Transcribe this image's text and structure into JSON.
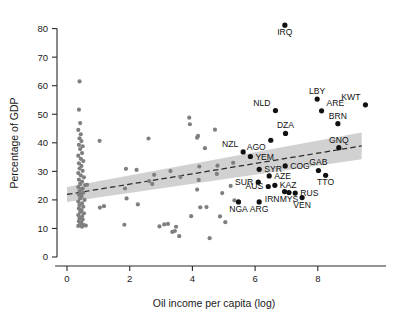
{
  "chart_data": {
    "type": "scatter",
    "title": "",
    "xlabel": "Oil income per capita (log)",
    "ylabel": "Percentage of GDP",
    "xlim": [
      -0.45,
      10.4
    ],
    "ylim": [
      -1.5,
      84
    ],
    "xticks": [
      0,
      2,
      4,
      6,
      8
    ],
    "yticks": [
      0,
      10,
      20,
      30,
      40,
      50,
      60,
      70,
      80
    ],
    "grid": false,
    "legend": null,
    "colors": {
      "background_points": "#7f7f7f",
      "labeled_points": "#111111",
      "confidence_band": "#bfbfbf",
      "fit_line": "#2b2b2b",
      "axis": "#2b2b2b"
    },
    "fit": {
      "type": "linear",
      "style": "dashed",
      "x_start": 0.0,
      "y_start": 21.9,
      "x_end": 9.4,
      "y_end": 38.9,
      "band_halfwidth_start": 2.6,
      "band_halfwidth_end": 4.7
    },
    "labeled_points": [
      {
        "label": "IRQ",
        "x": 6.95,
        "y": 81.2,
        "label_pos": "below"
      },
      {
        "label": "KWT",
        "x": 9.52,
        "y": 53.3,
        "label_pos": "above-left"
      },
      {
        "label": "LBY",
        "x": 7.98,
        "y": 55.3,
        "label_pos": "above"
      },
      {
        "label": "ARE",
        "x": 8.12,
        "y": 51.2,
        "label_pos": "above-right"
      },
      {
        "label": "BRN",
        "x": 8.64,
        "y": 46.7,
        "label_pos": "above"
      },
      {
        "label": "NLD",
        "x": 6.65,
        "y": 51.3,
        "label_pos": "above-left"
      },
      {
        "label": "DZA",
        "x": 6.97,
        "y": 43.3,
        "label_pos": "above"
      },
      {
        "label": "AGO",
        "x": 6.5,
        "y": 40.9,
        "label_pos": "below-left"
      },
      {
        "label": "GNQ",
        "x": 8.67,
        "y": 38.3,
        "label_pos": "above"
      },
      {
        "label": "NZL",
        "x": 5.62,
        "y": 36.8,
        "label_pos": "above-left"
      },
      {
        "label": "YEM",
        "x": 5.85,
        "y": 35.2,
        "label_pos": "right"
      },
      {
        "label": "SYR",
        "x": 6.13,
        "y": 30.7,
        "label_pos": "right"
      },
      {
        "label": "COG",
        "x": 6.96,
        "y": 31.9,
        "label_pos": "right"
      },
      {
        "label": "GAB",
        "x": 8.02,
        "y": 30.3,
        "label_pos": "above"
      },
      {
        "label": "TTO",
        "x": 8.25,
        "y": 28.6,
        "label_pos": "below"
      },
      {
        "label": "AZE",
        "x": 6.45,
        "y": 28.4,
        "label_pos": "right"
      },
      {
        "label": "SUR",
        "x": 6.1,
        "y": 26.2,
        "label_pos": "left"
      },
      {
        "label": "AUS",
        "x": 6.42,
        "y": 24.7,
        "label_pos": "left"
      },
      {
        "label": "KAZ",
        "x": 6.63,
        "y": 25.1,
        "label_pos": "right"
      },
      {
        "label": "IRN",
        "x": 6.94,
        "y": 22.9,
        "label_pos": "below-left"
      },
      {
        "label": "MYS",
        "x": 7.08,
        "y": 22.6,
        "label_pos": "below"
      },
      {
        "label": "RUS",
        "x": 7.28,
        "y": 22.4,
        "label_pos": "right"
      },
      {
        "label": "VEN",
        "x": 7.5,
        "y": 20.8,
        "label_pos": "below"
      },
      {
        "label": "NGA",
        "x": 5.47,
        "y": 19.3,
        "label_pos": "below"
      },
      {
        "label": "ARG",
        "x": 6.13,
        "y": 19.3,
        "label_pos": "below"
      }
    ],
    "background_points": [
      {
        "x": 0.4,
        "y": 61.5
      },
      {
        "x": 0.38,
        "y": 51.6
      },
      {
        "x": 0.42,
        "y": 46.9
      },
      {
        "x": 0.36,
        "y": 44.5
      },
      {
        "x": 0.44,
        "y": 43.0
      },
      {
        "x": 0.4,
        "y": 41.6
      },
      {
        "x": 0.46,
        "y": 40.6
      },
      {
        "x": 0.38,
        "y": 39.3
      },
      {
        "x": 0.5,
        "y": 38.8
      },
      {
        "x": 0.42,
        "y": 37.8
      },
      {
        "x": 0.48,
        "y": 36.4
      },
      {
        "x": 0.36,
        "y": 35.5
      },
      {
        "x": 0.44,
        "y": 34.4
      },
      {
        "x": 0.52,
        "y": 33.6
      },
      {
        "x": 0.38,
        "y": 32.8
      },
      {
        "x": 0.46,
        "y": 31.9
      },
      {
        "x": 0.4,
        "y": 31.0
      },
      {
        "x": 0.5,
        "y": 30.2
      },
      {
        "x": 0.36,
        "y": 29.4
      },
      {
        "x": 0.44,
        "y": 28.6
      },
      {
        "x": 0.54,
        "y": 27.9
      },
      {
        "x": 0.38,
        "y": 27.1
      },
      {
        "x": 0.48,
        "y": 26.4
      },
      {
        "x": 0.42,
        "y": 25.6
      },
      {
        "x": 0.58,
        "y": 25.2
      },
      {
        "x": 0.36,
        "y": 24.5
      },
      {
        "x": 0.46,
        "y": 23.8
      },
      {
        "x": 0.4,
        "y": 23.1
      },
      {
        "x": 0.52,
        "y": 22.5
      },
      {
        "x": 0.38,
        "y": 21.8
      },
      {
        "x": 0.46,
        "y": 21.2
      },
      {
        "x": 0.42,
        "y": 20.5
      },
      {
        "x": 0.56,
        "y": 20.0
      },
      {
        "x": 0.36,
        "y": 19.4
      },
      {
        "x": 0.48,
        "y": 18.8
      },
      {
        "x": 0.4,
        "y": 18.2
      },
      {
        "x": 0.52,
        "y": 17.6
      },
      {
        "x": 0.38,
        "y": 17.0
      },
      {
        "x": 0.46,
        "y": 16.4
      },
      {
        "x": 0.42,
        "y": 15.8
      },
      {
        "x": 0.54,
        "y": 15.3
      },
      {
        "x": 0.36,
        "y": 14.7
      },
      {
        "x": 0.48,
        "y": 14.2
      },
      {
        "x": 0.4,
        "y": 13.6
      },
      {
        "x": 0.5,
        "y": 13.1
      },
      {
        "x": 0.38,
        "y": 12.5
      },
      {
        "x": 0.46,
        "y": 12.0
      },
      {
        "x": 0.42,
        "y": 11.5
      },
      {
        "x": 0.54,
        "y": 11.2
      },
      {
        "x": 0.36,
        "y": 10.9
      },
      {
        "x": 0.48,
        "y": 10.6
      },
      {
        "x": 0.6,
        "y": 11.0
      },
      {
        "x": 0.44,
        "y": 22.0
      },
      {
        "x": 0.5,
        "y": 24.0
      },
      {
        "x": 0.64,
        "y": 25.3
      },
      {
        "x": 1.04,
        "y": 40.7
      },
      {
        "x": 1.05,
        "y": 17.3
      },
      {
        "x": 1.18,
        "y": 17.8
      },
      {
        "x": 1.88,
        "y": 30.9
      },
      {
        "x": 1.85,
        "y": 24.0
      },
      {
        "x": 1.9,
        "y": 20.5
      },
      {
        "x": 1.83,
        "y": 11.3
      },
      {
        "x": 2.22,
        "y": 30.5
      },
      {
        "x": 2.26,
        "y": 18.4
      },
      {
        "x": 2.6,
        "y": 41.5
      },
      {
        "x": 2.62,
        "y": 26.6
      },
      {
        "x": 2.78,
        "y": 28.8
      },
      {
        "x": 2.72,
        "y": 25.6
      },
      {
        "x": 2.95,
        "y": 10.7
      },
      {
        "x": 3.1,
        "y": 11.4
      },
      {
        "x": 3.22,
        "y": 11.6
      },
      {
        "x": 3.3,
        "y": 30.1
      },
      {
        "x": 3.36,
        "y": 8.8
      },
      {
        "x": 3.44,
        "y": 9.1
      },
      {
        "x": 3.48,
        "y": 10.6
      },
      {
        "x": 3.58,
        "y": 7.3
      },
      {
        "x": 3.62,
        "y": 28.0
      },
      {
        "x": 3.9,
        "y": 48.8
      },
      {
        "x": 3.92,
        "y": 46.5
      },
      {
        "x": 3.96,
        "y": 14.3
      },
      {
        "x": 4.15,
        "y": 41.8
      },
      {
        "x": 4.18,
        "y": 42.4
      },
      {
        "x": 4.22,
        "y": 31.7
      },
      {
        "x": 4.2,
        "y": 27.0
      },
      {
        "x": 4.15,
        "y": 23.6
      },
      {
        "x": 4.25,
        "y": 17.4
      },
      {
        "x": 4.45,
        "y": 17.5
      },
      {
        "x": 4.4,
        "y": 38.1
      },
      {
        "x": 4.55,
        "y": 6.6
      },
      {
        "x": 4.72,
        "y": 44.6
      },
      {
        "x": 4.78,
        "y": 29.1
      },
      {
        "x": 4.8,
        "y": 32.0
      },
      {
        "x": 4.88,
        "y": 14.2
      },
      {
        "x": 4.95,
        "y": 22.4
      },
      {
        "x": 5.05,
        "y": 12.2
      },
      {
        "x": 5.22,
        "y": 24.9
      },
      {
        "x": 5.3,
        "y": 33.0
      },
      {
        "x": 5.34,
        "y": 19.8
      }
    ]
  }
}
